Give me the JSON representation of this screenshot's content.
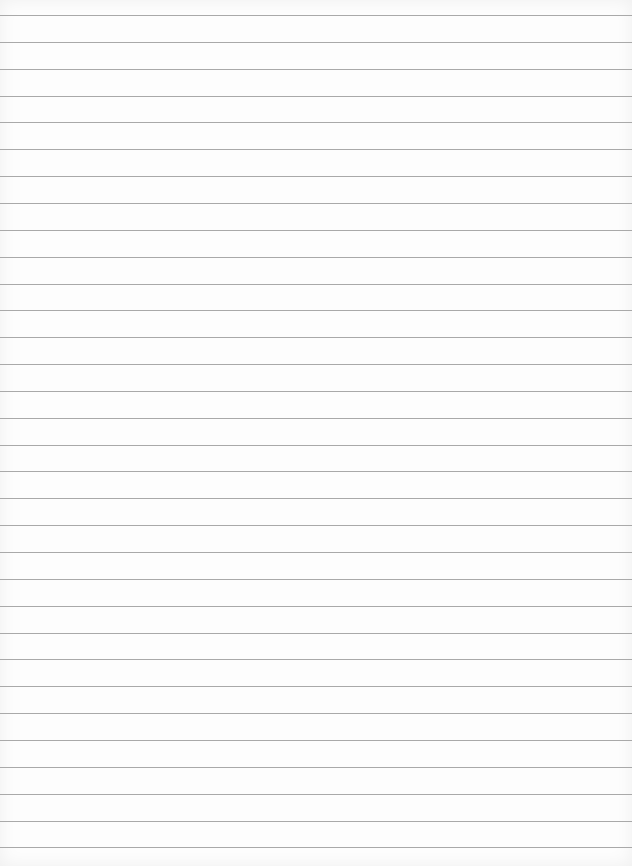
{
  "page": {
    "type": "lined-paper",
    "background_color": "#fdfdfd",
    "line_color": "#a9a9a9",
    "first_line_y": 15,
    "line_spacing": 26.85,
    "line_count": 32,
    "text": ""
  }
}
